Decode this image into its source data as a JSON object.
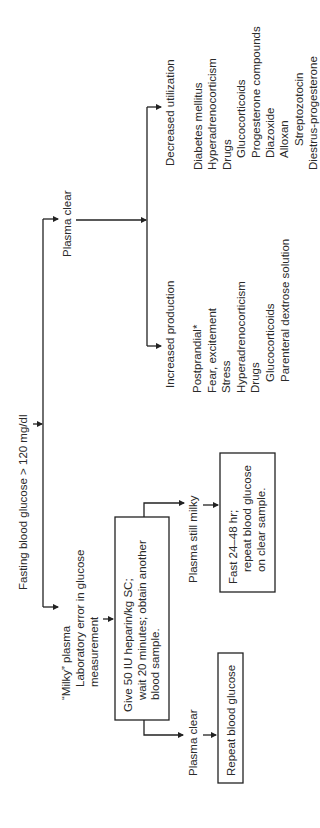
{
  "root": {
    "label": "Fasting blood glucose > 120 mg/dl"
  },
  "branch_clear": {
    "label": "Plasma clear",
    "increased": {
      "heading": "Increased production",
      "items": [
        {
          "text": "Postprandial*",
          "indent": 0
        },
        {
          "text": "Fear, excitement",
          "indent": 0
        },
        {
          "text": "Stress",
          "indent": 0
        },
        {
          "text": "Hyperadrenocorticism",
          "indent": 0
        },
        {
          "text": "Drugs",
          "indent": 0
        },
        {
          "text": "Glucocorticoids",
          "indent": 1
        },
        {
          "text": "Parenteral dextrose solution",
          "indent": 1
        }
      ]
    },
    "decreased": {
      "heading": "Decreased utilization",
      "items": [
        {
          "text": "Diabetes mellitus",
          "indent": 0
        },
        {
          "text": "Hyperadrenocorticism",
          "indent": 0
        },
        {
          "text": "Drugs",
          "indent": 0
        },
        {
          "text": "Glucocorticoids",
          "indent": 1
        },
        {
          "text": "Progesterone compounds",
          "indent": 1
        },
        {
          "text": "Diazoxide",
          "indent": 1
        },
        {
          "text": "Alloxan",
          "indent": 1
        },
        {
          "text": "Streptozotocin",
          "indent": 2
        },
        {
          "text": "Diestrus-progesterone",
          "indent": 0
        }
      ]
    }
  },
  "branch_milky": {
    "lines": [
      "“Milky” plasma",
      "Laboratory error in glucose",
      "measurement"
    ],
    "heparin_box": [
      "Give 50 IU heparin/kg SC;",
      "wait 20 minutes; obtain another",
      "blood sample."
    ],
    "still_milky": {
      "label": "Plasma still milky",
      "box": [
        "Fast 24–48 hr;",
        "repeat blood glucose",
        "on clear sample."
      ]
    },
    "now_clear": {
      "label": "Plasma clear",
      "box": [
        "Repeat blood glucose"
      ]
    }
  }
}
